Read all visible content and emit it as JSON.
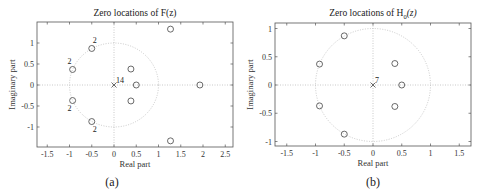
{
  "chart_data": [
    {
      "type": "scatter",
      "panel": "(a)",
      "title": "Zero locations of F(z)",
      "xlabel": "Real part",
      "ylabel": "Imaginary part",
      "xlim": [
        -1.7,
        2.7
      ],
      "ylim": [
        -1.5,
        1.5
      ],
      "xticks": [
        -1.5,
        -1,
        -0.5,
        0,
        0.5,
        1,
        1.5,
        2,
        2.5
      ],
      "xtick_labels": [
        "-1.5",
        "-1",
        "-0.5",
        "0",
        "0.5",
        "1",
        "1.5",
        "2",
        "2.5"
      ],
      "yticks": [
        1,
        0.5,
        0,
        -0.5,
        -1
      ],
      "ytick_labels": [
        "1",
        "0.5",
        "0",
        "-0.5",
        "-1"
      ],
      "unit_circle": true,
      "grid": "dotted axes through origin",
      "zeros": [
        {
          "re": -0.5,
          "im": 0.87,
          "multiplicity": 2
        },
        {
          "re": -0.93,
          "im": 0.37,
          "multiplicity": 2
        },
        {
          "re": -0.93,
          "im": -0.37,
          "multiplicity": 2
        },
        {
          "re": -0.5,
          "im": -0.87,
          "multiplicity": 2
        },
        {
          "re": 0.38,
          "im": 0.38,
          "multiplicity": 1
        },
        {
          "re": 0.38,
          "im": -0.38,
          "multiplicity": 1
        },
        {
          "re": 0.5,
          "im": 0,
          "multiplicity": 1
        },
        {
          "re": 1.27,
          "im": 1.33,
          "multiplicity": 1
        },
        {
          "re": 1.27,
          "im": -1.33,
          "multiplicity": 1
        },
        {
          "re": 1.93,
          "im": 0,
          "multiplicity": 1
        }
      ],
      "poles": [
        {
          "re": 0,
          "im": 0,
          "multiplicity": 14
        }
      ]
    },
    {
      "type": "scatter",
      "panel": "(b)",
      "title_prefix": "Zero locations of H",
      "title_sub": "0",
      "title_suffix": "(z)",
      "xlabel": "Real part",
      "ylabel": "Imaginary part",
      "xlim": [
        -1.65,
        1.65
      ],
      "ylim": [
        -1.1,
        1.1
      ],
      "xticks": [
        -1.5,
        -1,
        -0.5,
        0,
        0.5,
        1,
        1.5
      ],
      "xtick_labels": [
        "-1.5",
        "-1",
        "-0.5",
        "0",
        "0.5",
        "1",
        "1.5"
      ],
      "yticks": [
        1,
        0.5,
        0,
        -0.5,
        -1
      ],
      "ytick_labels": [
        "1",
        "0.5",
        "0",
        "-0.5",
        "-1"
      ],
      "unit_circle": true,
      "grid": "dotted axes through origin",
      "zeros": [
        {
          "re": -0.5,
          "im": 0.87,
          "multiplicity": 1
        },
        {
          "re": -0.93,
          "im": 0.37,
          "multiplicity": 1
        },
        {
          "re": -0.93,
          "im": -0.37,
          "multiplicity": 1
        },
        {
          "re": -0.5,
          "im": -0.87,
          "multiplicity": 1
        },
        {
          "re": 0.38,
          "im": 0.38,
          "multiplicity": 1
        },
        {
          "re": 0.38,
          "im": -0.38,
          "multiplicity": 1
        },
        {
          "re": 0.5,
          "im": 0,
          "multiplicity": 1
        }
      ],
      "poles": [
        {
          "re": 0,
          "im": 0,
          "multiplicity": 7
        }
      ]
    }
  ],
  "labels": {
    "a_title": "Zero locations of F(z)",
    "b_title_main": "Zero locations of H",
    "b_title_sub": "0",
    "b_title_end": "(z)",
    "xlabel": "Real part",
    "ylabel": "Imaginary part",
    "caption_a": "(a)",
    "caption_b": "(b)",
    "mult_2": "2",
    "pole_a": "14",
    "pole_b": "7"
  }
}
